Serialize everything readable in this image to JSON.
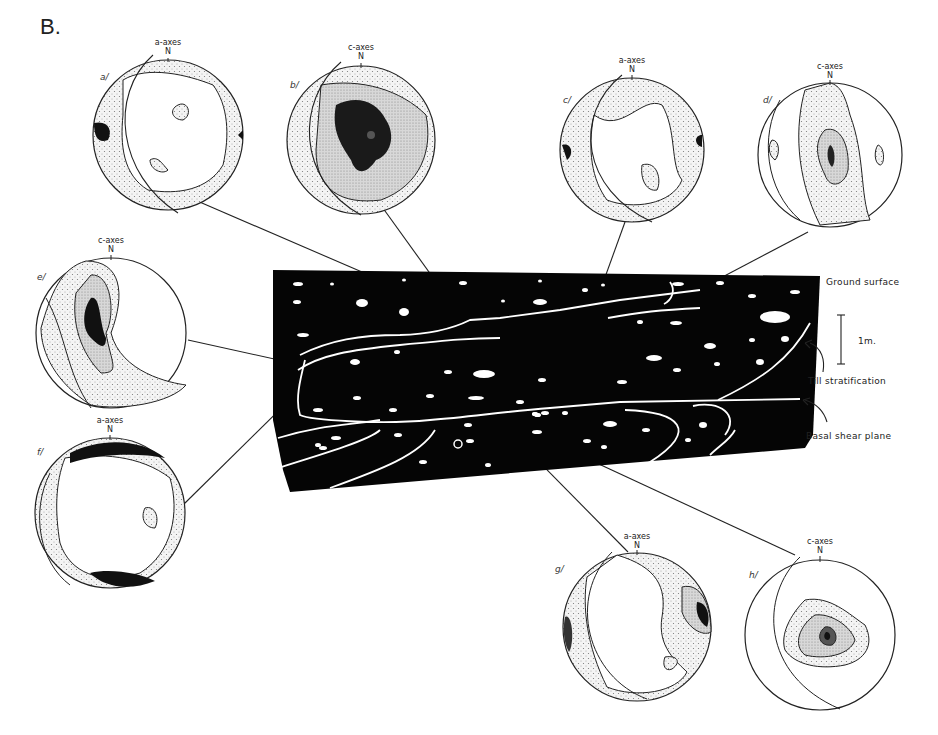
{
  "figure": {
    "panel_label": "B.",
    "annotations": {
      "ground_surface": "Ground surface",
      "scale": "1m.",
      "till_stratification": "Till stratification",
      "basal_shear_plane": "Basal shear plane"
    },
    "nets": [
      {
        "id": "a",
        "label": "a/",
        "axes": "a-axes",
        "north": "N"
      },
      {
        "id": "b",
        "label": "b/",
        "axes": "c-axes",
        "north": "N"
      },
      {
        "id": "c",
        "label": "c/",
        "axes": "a-axes",
        "north": "N"
      },
      {
        "id": "d",
        "label": "d/",
        "axes": "c-axes",
        "north": "N"
      },
      {
        "id": "e",
        "label": "e/",
        "axes": "c-axes",
        "north": "N"
      },
      {
        "id": "f",
        "label": "f/",
        "axes": "a-axes",
        "north": "N"
      },
      {
        "id": "g",
        "label": "g/",
        "axes": "a-axes",
        "north": "N"
      },
      {
        "id": "h",
        "label": "h/",
        "axes": "c-axes",
        "north": "N"
      }
    ]
  }
}
